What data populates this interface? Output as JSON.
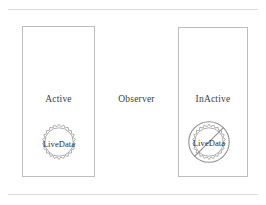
{
  "diagram": {
    "title_visible": false,
    "center_label": "Observer",
    "states": [
      {
        "id": "active",
        "label": "Active",
        "badge": {
          "label": "LiveData",
          "shape": "starburst-seal",
          "prohibited": false
        }
      },
      {
        "id": "inactive",
        "label": "InActive",
        "badge": {
          "label": "LiveData",
          "shape": "starburst-seal",
          "prohibited": true
        }
      }
    ],
    "colors": {
      "background": "#ffffff",
      "box_border": "#bdbdbd",
      "rule": "#d8d8d8",
      "text": "#3c3c3c",
      "badge_stroke": "#9a9a9a",
      "prohibition_stroke": "#8f8f8f"
    }
  }
}
